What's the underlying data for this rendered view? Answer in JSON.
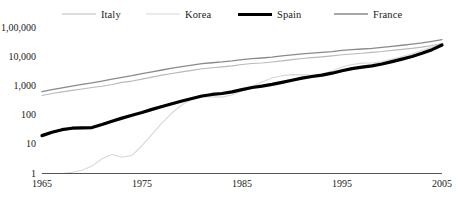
{
  "chart_data": {
    "type": "line",
    "title": "",
    "xlabel": "",
    "ylabel": "",
    "xlim": [
      1965,
      2005
    ],
    "ylim": [
      1,
      100000
    ],
    "yscale": "log",
    "grid": false,
    "legend_position": "top",
    "ytick_labels": [
      "1,00,000",
      "10,000",
      "1,000",
      "100",
      "10",
      "1"
    ],
    "ytick_values": [
      100000,
      10000,
      1000,
      100,
      10,
      1
    ],
    "xtick_labels": [
      "1965",
      "1975",
      "1985",
      "1995",
      "2005"
    ],
    "xtick_values": [
      1965,
      1975,
      1985,
      1995,
      2005
    ],
    "x": [
      1965,
      1966,
      1967,
      1968,
      1969,
      1970,
      1971,
      1972,
      1973,
      1974,
      1975,
      1976,
      1977,
      1978,
      1979,
      1980,
      1981,
      1982,
      1983,
      1984,
      1985,
      1986,
      1987,
      1988,
      1989,
      1990,
      1991,
      1992,
      1993,
      1994,
      1995,
      1996,
      1997,
      1998,
      1999,
      2000,
      2001,
      2002,
      2003,
      2004,
      2005
    ],
    "series": [
      {
        "name": "Italy",
        "color": "#b9b9b9",
        "width": 1.1,
        "values": [
          480,
          560,
          640,
          720,
          800,
          900,
          1000,
          1150,
          1350,
          1500,
          1750,
          2050,
          2400,
          2750,
          3100,
          3500,
          4000,
          4300,
          4600,
          5000,
          5600,
          6000,
          6300,
          6800,
          7400,
          8200,
          9000,
          9600,
          10200,
          11000,
          12000,
          12800,
          13500,
          14500,
          15500,
          17000,
          18500,
          20000,
          22000,
          25000,
          29000
        ]
      },
      {
        "name": "Korea",
        "color": "#d8d8d8",
        "width": 1.1,
        "values": [
          1,
          1,
          1,
          1.1,
          1.3,
          1.8,
          3.2,
          4.5,
          3.6,
          4.2,
          9,
          22,
          55,
          120,
          230,
          360,
          430,
          430,
          420,
          500,
          700,
          1000,
          1400,
          1900,
          2300,
          2500,
          2450,
          2400,
          2600,
          3300,
          4600,
          5600,
          6200,
          6300,
          7000,
          8500,
          10500,
          13000,
          17000,
          22000,
          30000
        ]
      },
      {
        "name": "Spain",
        "color": "#000000",
        "width": 3.2,
        "values": [
          20,
          26,
          32,
          36,
          37,
          38,
          48,
          62,
          80,
          100,
          125,
          160,
          200,
          250,
          310,
          380,
          460,
          520,
          560,
          640,
          760,
          900,
          1000,
          1150,
          1350,
          1600,
          1900,
          2150,
          2400,
          2800,
          3400,
          4000,
          4500,
          5000,
          5800,
          7000,
          8500,
          10500,
          13500,
          18000,
          26000
        ]
      },
      {
        "name": "France",
        "color": "#8a8a8a",
        "width": 1.3,
        "values": [
          650,
          760,
          880,
          1000,
          1150,
          1300,
          1500,
          1750,
          2000,
          2300,
          2700,
          3100,
          3600,
          4200,
          4700,
          5300,
          6000,
          6400,
          6800,
          7400,
          8200,
          8800,
          9300,
          10000,
          11000,
          12000,
          13000,
          13800,
          14500,
          15500,
          17000,
          18000,
          19000,
          20000,
          21500,
          23500,
          25500,
          28000,
          31000,
          35000,
          40000
        ]
      }
    ]
  },
  "legend": {
    "items": [
      {
        "label": "Italy"
      },
      {
        "label": "Korea"
      },
      {
        "label": "Spain"
      },
      {
        "label": "France"
      }
    ]
  }
}
